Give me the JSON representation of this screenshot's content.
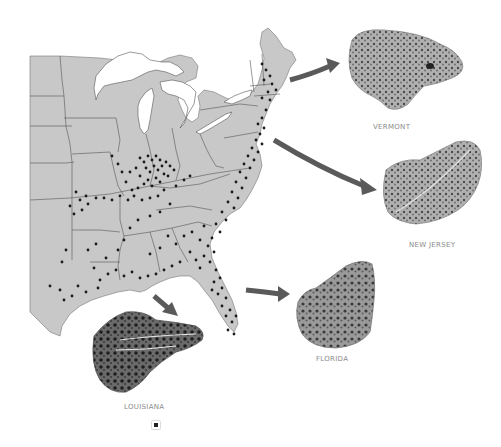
{
  "figure": {
    "type": "range map with specimen illustrations",
    "map": {
      "region": "Eastern United States",
      "fill_color": "#c8c8c8",
      "border_color": "#555555",
      "water_color": "#ffffff",
      "dot_color": "#1a1a1a",
      "description": "Locality dots concentrated in the Ohio Valley, Atlantic coast, and Gulf coast"
    },
    "arrow_color": "#5a5a5a",
    "specimens": [
      {
        "id": "vermont",
        "label": "VERMONT"
      },
      {
        "id": "new-jersey",
        "label": "NEW JERSEY"
      },
      {
        "id": "florida",
        "label": "FLORIDA"
      },
      {
        "id": "louisiana",
        "label": "LOUISIANA"
      }
    ],
    "label_color": "#8a8a8a",
    "footer_icon": "square-bullet-icon"
  }
}
